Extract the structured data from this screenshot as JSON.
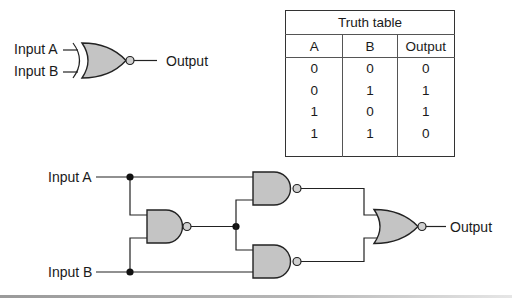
{
  "xnor_symbol": {
    "input_a_label": "Input A",
    "input_b_label": "Input B",
    "output_label": "Output",
    "gate_type": "XNOR"
  },
  "truth_table": {
    "title": "Truth table",
    "headers": [
      "A",
      "B",
      "Output"
    ],
    "rows": [
      [
        "0",
        "0",
        "0"
      ],
      [
        "0",
        "1",
        "1"
      ],
      [
        "1",
        "0",
        "1"
      ],
      [
        "1",
        "1",
        "0"
      ]
    ]
  },
  "circuit": {
    "input_a_label": "Input A",
    "input_b_label": "Input B",
    "output_label": "Output",
    "gates": [
      "NAND",
      "NAND",
      "NAND",
      "NOR"
    ]
  }
}
